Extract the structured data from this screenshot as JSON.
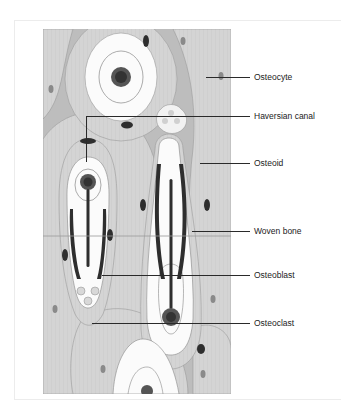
{
  "figure": {
    "labels": [
      {
        "id": "osteocyte",
        "text": "Osteocyte"
      },
      {
        "id": "haversian-canal",
        "text": "Haversian canal"
      },
      {
        "id": "osteoid",
        "text": "Osteoid"
      },
      {
        "id": "woven-bone",
        "text": "Woven bone"
      },
      {
        "id": "osteoblast",
        "text": "Osteoblast"
      },
      {
        "id": "osteoclast",
        "text": "Osteoclast"
      }
    ]
  },
  "colors": {
    "bone_matrix": "#cfcfcf",
    "lamella_light": "#e2e2e2",
    "canal_white": "#fbfbfb",
    "cell_dark": "#3a3a3a",
    "osteoid_dark": "#2e2e2e",
    "leader_line": "#2a2a2a",
    "label_text": "#222222"
  }
}
